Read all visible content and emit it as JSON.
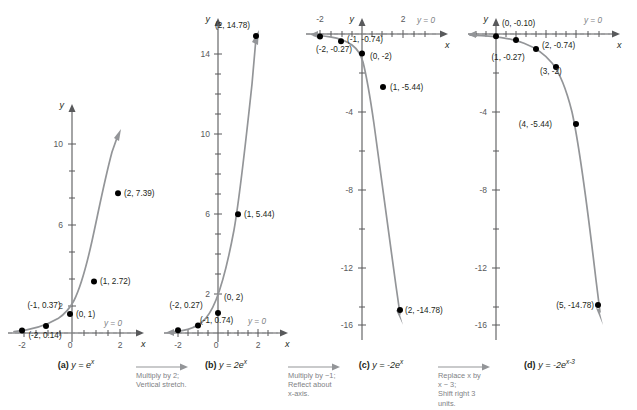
{
  "figure": {
    "curve_color": "#939598",
    "axis_color": "#58595b",
    "point_color": "#000000",
    "asymptote_color": "#939598"
  },
  "panels": [
    {
      "id": "a",
      "label": "(a)",
      "caption_html": "y = e<sup>x</sup>",
      "caption_plain": "y = e^x",
      "axis_x_label": "x",
      "axis_y_label": "y",
      "x_ticks": [
        "-2",
        "0",
        "2"
      ],
      "y_ticks": [
        "2",
        "6",
        "10"
      ],
      "asymptote_label": "y = 0",
      "points": [
        {
          "label": "(-2, 0.14)",
          "x": -2,
          "y": 0.14
        },
        {
          "label": "(-1, 0.37)",
          "x": -1,
          "y": 0.37
        },
        {
          "label": "(0, 1)",
          "x": 0,
          "y": 1
        },
        {
          "label": "(1, 2.72)",
          "x": 1,
          "y": 2.72
        },
        {
          "label": "(2, 7.39)",
          "x": 2,
          "y": 7.39
        }
      ]
    },
    {
      "id": "b",
      "label": "(b)",
      "caption_html": "y = 2e<sup>x</sup>",
      "caption_plain": "y = 2e^x",
      "axis_x_label": "x",
      "axis_y_label": "y",
      "x_ticks": [
        "-2",
        "0",
        "2"
      ],
      "y_ticks": [
        "2",
        "6",
        "10",
        "14"
      ],
      "asymptote_label": "y = 0",
      "points": [
        {
          "label": "(-2, 0.27)",
          "x": -2,
          "y": 0.27
        },
        {
          "label": "(-1, 0.74)",
          "x": -1,
          "y": 0.74
        },
        {
          "label": "(0, 2)",
          "x": 0,
          "y": 2
        },
        {
          "label": "(1, 5.44)",
          "x": 1,
          "y": 5.44
        },
        {
          "label": "(2, 14.78)",
          "x": 2,
          "y": 14.78
        }
      ]
    },
    {
      "id": "c",
      "label": "(c)",
      "caption_html": "y = -2e<sup>x</sup>",
      "caption_plain": "y = -2e^x",
      "axis_x_label": "x",
      "axis_y_label": "y",
      "x_ticks": [
        "-2",
        "2"
      ],
      "y_ticks": [
        "-4",
        "-8",
        "-12",
        "-16"
      ],
      "asymptote_label": "y = 0",
      "points": [
        {
          "label": "(-2, -0.27)",
          "x": -2,
          "y": -0.27
        },
        {
          "label": "(-1, -0.74)",
          "x": -1,
          "y": -0.74
        },
        {
          "label": "(0, -2)",
          "x": 0,
          "y": -2
        },
        {
          "label": "(1, -5.44)",
          "x": 1,
          "y": -5.44
        },
        {
          "label": "(2, -14.78)",
          "x": 2,
          "y": -14.78
        }
      ]
    },
    {
      "id": "d",
      "label": "(d)",
      "caption_html": "y = -2e<sup>x-3</sup>",
      "caption_plain": "y = -2e^(x-3)",
      "axis_x_label": "x",
      "axis_y_label": "y",
      "x_ticks": [],
      "y_ticks": [
        "-4",
        "-8",
        "-12",
        "-16"
      ],
      "asymptote_label": "y = 0",
      "points": [
        {
          "label": "(0, -0.10)",
          "x": 0,
          "y": -0.1
        },
        {
          "label": "(1, -0.27)",
          "x": 1,
          "y": -0.27
        },
        {
          "label": "(2, -0.74)",
          "x": 2,
          "y": -0.74
        },
        {
          "label": "(3, -2)",
          "x": 3,
          "y": -2
        },
        {
          "label": "(4, -5.44)",
          "x": 4,
          "y": -5.44
        },
        {
          "label": "(5, -14.78)",
          "x": 5,
          "y": -14.78
        }
      ]
    }
  ],
  "transitions": [
    {
      "id": "a-to-b",
      "line1": "Multiply by 2;",
      "line2": "Vertical stretch.",
      "line3": "",
      "line4": ""
    },
    {
      "id": "b-to-c",
      "line1": "Multiply by −1;",
      "line2": "Reflect about",
      "line3": "x-axis.",
      "line4": ""
    },
    {
      "id": "c-to-d",
      "line1": "Replace x by",
      "line2": "x − 3;",
      "line3": "Shift right 3",
      "line4": "units."
    }
  ],
  "chart_data": {
    "type": "line",
    "xlabel": "x",
    "ylabel": "y",
    "grid": false,
    "legend": "none",
    "series": [
      {
        "name": "y = e^x",
        "panel": "a",
        "x": [
          -2,
          -1,
          0,
          1,
          2
        ],
        "values": [
          0.14,
          0.37,
          1,
          2.72,
          7.39
        ],
        "xlim": [
          -2.6,
          2.6
        ],
        "ylim": [
          -0.6,
          11.5
        ],
        "asymptote": 0
      },
      {
        "name": "y = 2e^x",
        "panel": "b",
        "x": [
          -2,
          -1,
          0,
          1,
          2
        ],
        "values": [
          0.27,
          0.74,
          2,
          5.44,
          14.78
        ],
        "xlim": [
          -2.6,
          2.6
        ],
        "ylim": [
          -1.2,
          16.5
        ],
        "asymptote": 0
      },
      {
        "name": "y = -2e^x",
        "panel": "c",
        "x": [
          -2,
          -1,
          0,
          1,
          2
        ],
        "values": [
          -0.27,
          -0.74,
          -2,
          -5.44,
          -14.78
        ],
        "xlim": [
          -2.8,
          2.8
        ],
        "ylim": [
          -17.5,
          1.2
        ],
        "asymptote": 0
      },
      {
        "name": "y = -2e^(x-3)",
        "panel": "d",
        "x": [
          0,
          1,
          2,
          3,
          4,
          5
        ],
        "values": [
          -0.1,
          -0.27,
          -0.74,
          -2,
          -5.44,
          -14.78
        ],
        "xlim": [
          -0.8,
          5.8
        ],
        "ylim": [
          -17.5,
          1.2
        ],
        "asymptote": 0
      }
    ]
  }
}
